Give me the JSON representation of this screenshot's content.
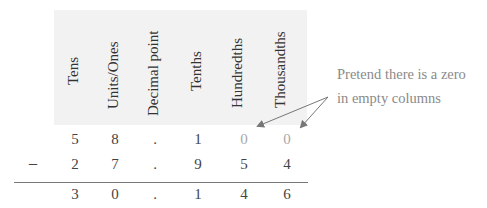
{
  "columns": [
    {
      "label": "Tens",
      "x": 75
    },
    {
      "label": "Units/Ones",
      "x": 115
    },
    {
      "label": "Decimal point",
      "x": 155
    },
    {
      "label": "Tenths",
      "x": 198
    },
    {
      "label": "Hundredths",
      "x": 240
    },
    {
      "label": "Thousandths",
      "x": 285
    }
  ],
  "rows": {
    "minuend": [
      "5",
      "8",
      ".",
      "1",
      "0",
      "0"
    ],
    "subtrahend": [
      "2",
      "7",
      ".",
      "9",
      "5",
      "4"
    ],
    "result": [
      "3",
      "0",
      ".",
      "1",
      "4",
      "6"
    ]
  },
  "operator": "–",
  "annotation": {
    "line1": "Pretend there is a zero",
    "line2": "in empty columns"
  },
  "colors": {
    "header_bg": "#f2f2f2",
    "text": "#333333",
    "placeholder_zero": "#a8a8a8",
    "annotation": "#8a8a8a",
    "arrow": "#777777"
  }
}
